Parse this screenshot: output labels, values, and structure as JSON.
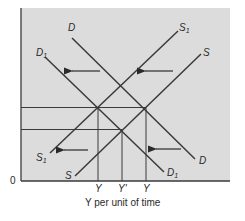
{
  "diagram": {
    "type": "supply-demand-shift",
    "background_color": "#dcdcdc",
    "line_color": "#3a3a3a",
    "origin_label": "0",
    "x_axis_label": "Y per unit of time",
    "x_tick_labels": [
      "Y",
      "Y'",
      "Y"
    ],
    "curves": [
      {
        "name": "D",
        "label": "D",
        "sub": ""
      },
      {
        "name": "D1",
        "label": "D",
        "sub": "1"
      },
      {
        "name": "S",
        "label": "S",
        "sub": ""
      },
      {
        "name": "S1",
        "label": "S",
        "sub": "1"
      }
    ],
    "labels": {
      "D_top": "D",
      "D_bottom": "D",
      "D1_top": "D",
      "D1_bottom": "D",
      "S_top": "S",
      "S_bottom": "S",
      "S1_top": "S",
      "S1_bottom": "S",
      "sub1": "1"
    },
    "arrows": [
      "left",
      "left",
      "left",
      "left"
    ],
    "equilibria": [
      {
        "name": "E-left",
        "between": [
          "D1",
          "S1"
        ]
      },
      {
        "name": "E-right",
        "between": [
          "D",
          "S"
        ]
      },
      {
        "name": "E-mid",
        "between": [
          "D1",
          "S"
        ]
      }
    ]
  }
}
